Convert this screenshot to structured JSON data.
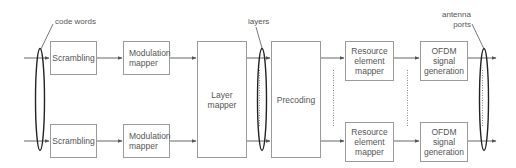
{
  "diagram": {
    "type": "LTE downlink physical channel processing block diagram",
    "labels": {
      "code_words": "code words",
      "layers": "layers",
      "antenna_ports": "antenna\nports"
    },
    "blocks": {
      "scrambling_top": "Scrambling",
      "scrambling_bottom": "Scrambling",
      "modulation_top": "Modulation\nmapper",
      "modulation_bottom": "Modulation\nmapper",
      "layer_mapper": "Layer\nmapper",
      "precoding": "Precoding",
      "re_mapper_top": "Resource\nelement\nmapper",
      "re_mapper_bottom": "Resource\nelement\nmapper",
      "ofdm_top": "OFDM\nsignal\ngeneration",
      "ofdm_bottom": "OFDM\nsignal\ngeneration"
    },
    "colors": {
      "box_border": "#9a9a9a",
      "line": "#555555",
      "ellipse": "#222222",
      "text": "#555555"
    }
  }
}
